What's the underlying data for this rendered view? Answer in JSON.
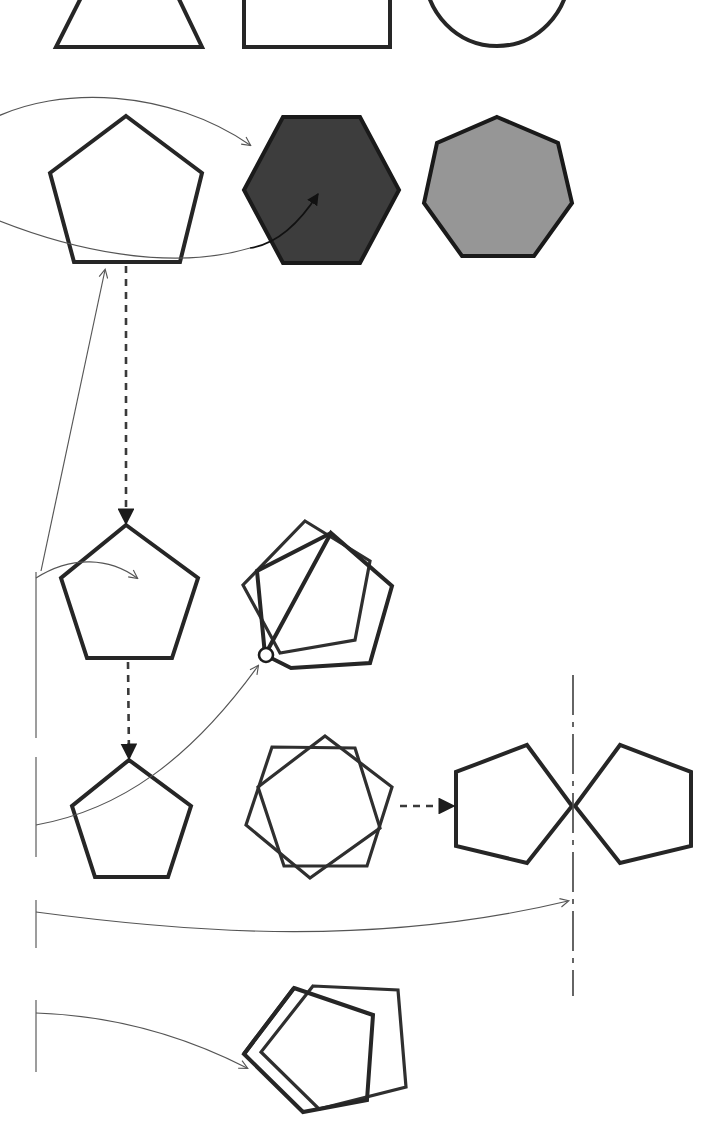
{
  "figure": {
    "width": 726,
    "height": 1145,
    "background_color": "#ffffff"
  },
  "palette": {
    "outline_stroke": "#262626",
    "thin_stroke": "#2f2f2f",
    "leader_stroke": "#555555",
    "dark_fill": "#3d3d3d",
    "gray_fill": "#969696",
    "axis_stroke": "#4a4a4a",
    "flow_stroke": "#3a3a3a",
    "pivot_fill": "#ffffff"
  },
  "rows": [
    {
      "id": "row-top",
      "label": "basic-shapes-row",
      "note": "cropped at top edge of figure",
      "shapes": [
        {
          "name": "triangle",
          "sides": 3,
          "fill": "none"
        },
        {
          "name": "square",
          "sides": 4,
          "fill": "none"
        },
        {
          "name": "circle",
          "sides": 0,
          "fill": "none"
        }
      ]
    },
    {
      "id": "row-polygons",
      "label": "filled-polygons-row",
      "shapes": [
        {
          "name": "pentagon",
          "sides": 5,
          "fill": "none"
        },
        {
          "name": "hexagon",
          "sides": 6,
          "fill": "#3d3d3d"
        },
        {
          "name": "heptagon",
          "sides": 7,
          "fill": "#969696"
        }
      ]
    },
    {
      "id": "row-rotation",
      "label": "rotation-row",
      "shapes": [
        {
          "name": "pentagon-source",
          "sides": 5,
          "fill": "none"
        },
        {
          "name": "pentagon-rotated-pair",
          "sides": 5,
          "fill": "none",
          "pivot": "vertex"
        }
      ]
    },
    {
      "id": "row-mirror",
      "label": "mirror-row",
      "shapes": [
        {
          "name": "pentagon-source",
          "sides": 5,
          "fill": "none"
        },
        {
          "name": "pentagon-rotated-overlay",
          "sides": 5,
          "fill": "none",
          "pivot": "center"
        },
        {
          "name": "pentagon-before-mirror",
          "sides": 5,
          "fill": "none"
        },
        {
          "name": "pentagon-after-mirror",
          "sides": 5,
          "fill": "none"
        }
      ]
    },
    {
      "id": "row-bottom",
      "label": "tilted-overlay-row",
      "shapes": [
        {
          "name": "pentagon-tilted-pair",
          "sides": 5,
          "fill": "none"
        }
      ]
    }
  ],
  "annotations": {
    "leaders": [
      {
        "id": "leader-to-hexagon",
        "target": "hexagon",
        "from_edge": "left"
      },
      {
        "id": "leader-to-hexagon-interior",
        "target": "hexagon-interior",
        "from_edge": "left"
      },
      {
        "id": "leader-to-pentagon-rotation",
        "target": "pentagon-source-rotation",
        "from_edge": "left"
      },
      {
        "id": "leader-to-pivot",
        "target": "rotation-pivot-point",
        "from_edge": "left"
      },
      {
        "id": "leader-to-mirror-axis",
        "target": "mirror-axis",
        "from_edge": "left"
      },
      {
        "id": "leader-to-tilted-pair",
        "target": "pentagon-tilted-pair",
        "from_edge": "left"
      }
    ],
    "flow_arrows": [
      {
        "id": "flow-pentagon-up",
        "direction": "up",
        "style": "solid-thin"
      },
      {
        "id": "flow-pentagon-down-1",
        "direction": "down",
        "style": "dashed"
      },
      {
        "id": "flow-pentagon-down-2",
        "direction": "down",
        "style": "dashed"
      },
      {
        "id": "flow-mirror-right",
        "direction": "right",
        "style": "dashed"
      }
    ],
    "axes": [
      {
        "id": "mirror-axis",
        "orientation": "vertical",
        "style": "dash-dot",
        "x": 573
      }
    ]
  }
}
